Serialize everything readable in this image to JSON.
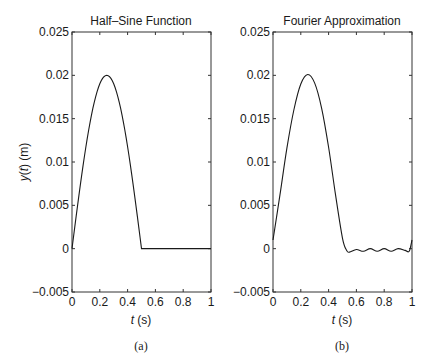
{
  "chart_data": [
    {
      "type": "line",
      "panel": "(a)",
      "title": "Half–Sine Function",
      "xlabel": "t (s)",
      "ylabel": "y(t) (m)",
      "xlim": [
        0,
        1
      ],
      "ylim": [
        -0.005,
        0.025
      ],
      "xticks": [
        "0",
        "0.2",
        "0.4",
        "0.6",
        "0.8",
        "1"
      ],
      "yticks": [
        "−0.005",
        "0",
        "0.005",
        "0.01",
        "0.015",
        "0.02",
        "0.025"
      ],
      "grid": false,
      "series": [
        {
          "name": "half-sine",
          "description": "y = 0.02 sin(2π t) for 0 ≤ t ≤ 0.5, y = 0 for 0.5 < t ≤ 1",
          "x": [
            0,
            0.05,
            0.1,
            0.15,
            0.2,
            0.25,
            0.3,
            0.35,
            0.4,
            0.45,
            0.5,
            0.6,
            0.7,
            0.8,
            0.9,
            1.0
          ],
          "y": [
            0,
            0.00618,
            0.01176,
            0.01618,
            0.01902,
            0.02,
            0.01902,
            0.01618,
            0.01176,
            0.00618,
            0,
            0,
            0,
            0,
            0,
            0
          ]
        }
      ]
    },
    {
      "type": "line",
      "panel": "(b)",
      "title": "Fourier Approximation",
      "xlabel": "t (s)",
      "ylabel": "",
      "xlim": [
        0,
        1
      ],
      "ylim": [
        -0.005,
        0.025
      ],
      "xticks": [
        "0",
        "0.2",
        "0.4",
        "0.6",
        "0.8",
        "1"
      ],
      "yticks": [
        "−0.005",
        "0",
        "0.005",
        "0.01",
        "0.015",
        "0.02",
        "0.025"
      ],
      "grid": false,
      "series": [
        {
          "name": "fourier-approximation",
          "x": [
            0,
            0.05,
            0.1,
            0.15,
            0.2,
            0.25,
            0.3,
            0.35,
            0.4,
            0.45,
            0.5,
            0.53,
            0.55,
            0.6,
            0.65,
            0.7,
            0.75,
            0.8,
            0.85,
            0.9,
            0.95,
            0.98,
            1.0
          ],
          "y": [
            0.001,
            0.0062,
            0.0116,
            0.016,
            0.019,
            0.0201,
            0.0191,
            0.0162,
            0.0117,
            0.0062,
            0.0012,
            -0.0002,
            -0.0004,
            -0.0001,
            -0.0003,
            0.0,
            -0.0003,
            0.0,
            -0.0003,
            0.0,
            -0.0002,
            -0.0003,
            0.001
          ]
        }
      ]
    }
  ],
  "panels": {
    "a": {
      "title": "Half–Sine Function",
      "caption": "(a)",
      "ylabel_var": "y",
      "ylabel_arg": "t",
      "ylabel_unit": "(m)",
      "xlabel_var": "t",
      "xlabel_unit": "(s)"
    },
    "b": {
      "title": "Fourier Approximation",
      "caption": "(b)",
      "xlabel_var": "t",
      "xlabel_unit": "(s)"
    }
  },
  "ticks": {
    "x": [
      "0",
      "0.2",
      "0.4",
      "0.6",
      "0.8",
      "1"
    ],
    "y": [
      "−0.005",
      "0",
      "0.005",
      "0.01",
      "0.015",
      "0.02",
      "0.025"
    ]
  },
  "colors": {
    "line": "#1a1a1a",
    "axes": "#333333",
    "background": "#ffffff"
  }
}
